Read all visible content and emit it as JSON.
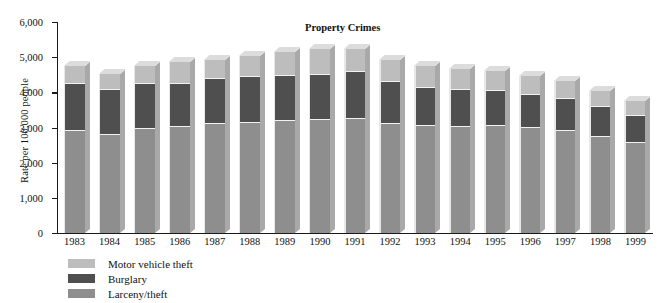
{
  "chart_data": {
    "type": "bar",
    "stacked": true,
    "title": "Property Crimes",
    "xlabel": "",
    "ylabel": "Rate per 100,000 people",
    "ylim": [
      0,
      6000
    ],
    "ytick_labels": [
      "6,000",
      "5,000",
      "4,000",
      "3,000",
      "2,000",
      "1,000",
      "0"
    ],
    "ytick_values": [
      6000,
      5000,
      4000,
      3000,
      2000,
      1000,
      0
    ],
    "grid": false,
    "legend_position": "below-left",
    "categories": [
      "1983",
      "1984",
      "1985",
      "1986",
      "1987",
      "1988",
      "1989",
      "1990",
      "1991",
      "1992",
      "1993",
      "1994",
      "1995",
      "1996",
      "1997",
      "1998",
      "1999"
    ],
    "series": [
      {
        "name": "Larceny/theft",
        "color": "#8e8e8e",
        "values": [
          2890,
          2800,
          2950,
          3010,
          3090,
          3130,
          3180,
          3200,
          3230,
          3100,
          3030,
          3020,
          3040,
          2980,
          2890,
          2730,
          2550
        ]
      },
      {
        "name": "Burglary",
        "color": "#4f4f4f",
        "values": [
          1340,
          1270,
          1290,
          1230,
          1300,
          1310,
          1280,
          1300,
          1340,
          1190,
          1090,
          1040,
          990,
          950,
          920,
          860,
          770
        ]
      },
      {
        "name": "Motor vehicle theft",
        "color": "#bdbdbd",
        "values": [
          510,
          450,
          500,
          630,
          530,
          580,
          680,
          720,
          660,
          630,
          630,
          600,
          570,
          530,
          510,
          460,
          420
        ]
      }
    ],
    "totals": [
      4740,
      4520,
      4740,
      4870,
      4920,
      5020,
      5140,
      5220,
      5230,
      4920,
      4750,
      4660,
      4600,
      4460,
      4320,
      4050,
      3740
    ]
  },
  "legend": {
    "items": [
      {
        "label": "Motor vehicle theft",
        "swatch": "motor"
      },
      {
        "label": "Burglary",
        "swatch": "burglary"
      },
      {
        "label": "Larceny/theft",
        "swatch": "larceny"
      }
    ]
  }
}
